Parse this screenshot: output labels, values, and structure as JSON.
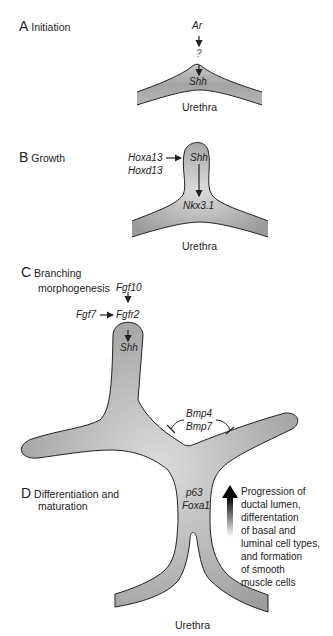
{
  "panels": {
    "A": {
      "letter": "A",
      "title": "Initiation",
      "genes": {
        "top": "Ar",
        "middle": "?",
        "target": "Shh"
      },
      "structure_label": "Urethra"
    },
    "B": {
      "letter": "B",
      "title": "Growth",
      "genes": {
        "regulator1": "Hoxa13",
        "regulator2": "Hoxd13",
        "target": "Shh",
        "downstream": "Nkx3.1"
      },
      "structure_label": "Urethra"
    },
    "C": {
      "letter": "C",
      "title_line1": "Branching",
      "title_line2": "morphogenesis",
      "genes": {
        "ligand_top": "Fgf10",
        "ligand_left": "Fgf7",
        "receptor": "Fgfr2",
        "target": "Shh",
        "inhibitor1": "Bmp4",
        "inhibitor2": "Bmp7"
      }
    },
    "D": {
      "letter": "D",
      "title_line1": "Differentiation and",
      "title_line2": "maturation",
      "genes": {
        "marker1": "p63",
        "marker2": "Foxa1"
      },
      "structure_label": "Urethra",
      "description": [
        "Progression of",
        "ductal lumen,",
        "differentation",
        "of basal and",
        "luminal cell types,",
        "and formation",
        "of smooth",
        "muscle cells"
      ]
    }
  },
  "colors": {
    "tissue_fill": "#a9a9a9",
    "tissue_highlight": "#d8d8d8",
    "outline": "#222222"
  }
}
